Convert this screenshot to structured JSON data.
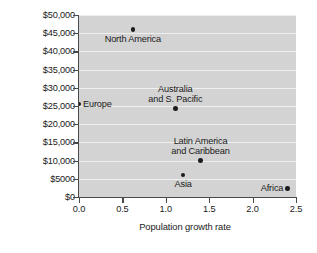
{
  "chart_data": {
    "type": "scatter",
    "title": "",
    "xlabel": "Population growth rate",
    "ylabel": "Per-capita income (GNI-PPP¹)",
    "ylabel_base": "Per-capita income (GNI-PPP",
    "ylabel_sup": "1",
    "ylabel_tail": ")",
    "xlim": [
      0.0,
      2.5
    ],
    "ylim": [
      0,
      50000
    ],
    "grid": "horizontal",
    "legend": "none",
    "plot_background": "#d3d3d3",
    "gridline_color": "#efefef",
    "point_color": "#1c1c1c",
    "axis_color": "#4a4a4a",
    "xticks": [
      "0.0",
      "0.5",
      "1.0",
      "1.5",
      "2.0",
      "2.5"
    ],
    "xtick_values": [
      0.0,
      0.5,
      1.0,
      1.5,
      2.0,
      2.5
    ],
    "yticks": [
      "$0",
      "$5000",
      "$10,000",
      "$15,000",
      "$20,000",
      "$25,000",
      "$30,000",
      "$35,000",
      "$40,000",
      "$45,000",
      "$50,000"
    ],
    "ytick_values": [
      0,
      5000,
      10000,
      15000,
      20000,
      25000,
      30000,
      35000,
      40000,
      45000,
      50000
    ],
    "points": [
      {
        "label": "North America",
        "x": 0.62,
        "y": 46000,
        "label_lines": [
          "North America"
        ],
        "label_pos": "below"
      },
      {
        "label": "Europe",
        "x": 0.0,
        "y": 25500,
        "label_lines": [
          "Europe"
        ],
        "label_pos": "right"
      },
      {
        "label": "Australia and S. Pacific",
        "x": 1.11,
        "y": 24300,
        "label_lines": [
          "Australia",
          "and S. Pacific"
        ],
        "label_pos": "above"
      },
      {
        "label": "Latin America and Caribbean",
        "x": 1.4,
        "y": 10000,
        "label_lines": [
          "Latin America",
          "and Caribbean"
        ],
        "label_pos": "above"
      },
      {
        "label": "Asia",
        "x": 1.2,
        "y": 6000,
        "label_lines": [
          "Asia"
        ],
        "label_pos": "below"
      },
      {
        "label": "Africa",
        "x": 2.4,
        "y": 2400,
        "label_lines": [
          "Africa"
        ],
        "label_pos": "left"
      }
    ]
  }
}
